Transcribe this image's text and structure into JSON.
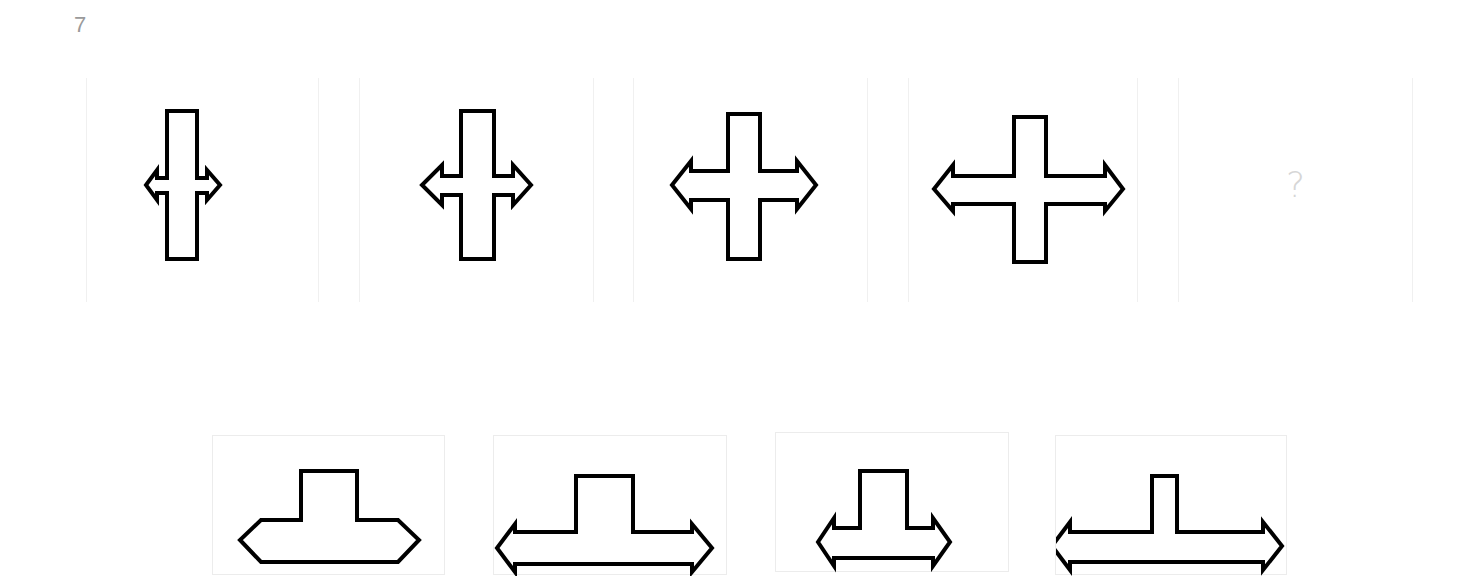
{
  "question": {
    "number": "7"
  },
  "sequence": [
    {
      "id": "fig-1",
      "shape": "cross-double-arrow",
      "bar_width": 30,
      "bar_height": 148,
      "arm_span": 74,
      "arm_thickness": 15
    },
    {
      "id": "fig-2",
      "shape": "cross-double-arrow",
      "bar_width": 33,
      "bar_height": 148,
      "arm_span": 109,
      "arm_thickness": 20
    },
    {
      "id": "fig-3",
      "shape": "cross-double-arrow",
      "bar_width": 32,
      "bar_height": 145,
      "arm_span": 144,
      "arm_thickness": 30
    },
    {
      "id": "fig-4",
      "shape": "cross-double-arrow",
      "bar_width": 32,
      "bar_height": 146,
      "arm_span": 190,
      "arm_thickness": 29
    },
    {
      "id": "fig-5",
      "shape": "unknown",
      "label": "?"
    }
  ],
  "options": [
    {
      "id": "option-A",
      "shape": "cross-wide-arms"
    },
    {
      "id": "option-B",
      "shape": "cross-double-arrow"
    },
    {
      "id": "option-C",
      "shape": "cross-double-arrow"
    },
    {
      "id": "option-D",
      "shape": "cross-double-arrow-narrow-bar"
    }
  ],
  "colors": {
    "stroke": "#000000",
    "question_mark": "#d6d6d6",
    "number": "#9a9a9a",
    "panel_border": "#ececec"
  }
}
